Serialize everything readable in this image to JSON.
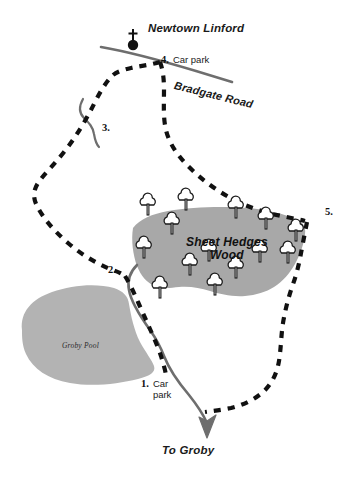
{
  "map": {
    "title": "Groby Pool and Sheet Hedges Wood walk map",
    "colors": {
      "water_fill": "#b3b3b3",
      "wood_fill": "#a8a8a8",
      "road": "#6e6e6e",
      "trail": "#111111",
      "text": "#1a1a1a",
      "background": "#ffffff"
    },
    "labels": {
      "settlement": "Newtown Linford",
      "wood_line1": "Sheet Hedges",
      "wood_line2": "Wood",
      "road": "Bradgate Road",
      "water": "Groby Pool",
      "destination": "To Groby"
    },
    "markers": [
      {
        "id": "marker-1",
        "number": "1.",
        "label_line1": "Car",
        "label_line2": "park"
      },
      {
        "id": "marker-2",
        "number": "2.",
        "label_line1": "",
        "label_line2": ""
      },
      {
        "id": "marker-3",
        "number": "3.",
        "label_line1": "",
        "label_line2": ""
      },
      {
        "id": "marker-4",
        "number": "4.",
        "label_line1": "Car park",
        "label_line2": ""
      },
      {
        "id": "marker-5",
        "number": "5.",
        "label_line1": "",
        "label_line2": ""
      }
    ],
    "symbols": {
      "church": "church-icon",
      "tree": "tree-icon",
      "arrow": "direction-arrow-icon"
    },
    "tree_count": 14
  }
}
